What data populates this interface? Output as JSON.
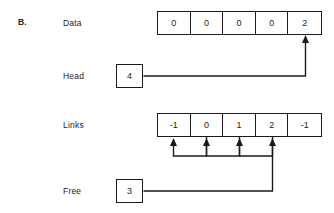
{
  "figure": {
    "part_label": "B.",
    "background_color": "#ffffff",
    "line_color": "#1a1a1a"
  },
  "rows": {
    "data": {
      "label": "Data",
      "cells": [
        "0",
        "0",
        "0",
        "0",
        "2"
      ]
    },
    "head": {
      "label": "Head",
      "value": "4"
    },
    "links": {
      "label": "Links",
      "cells": [
        "-1",
        "0",
        "1",
        "2",
        "-1"
      ]
    },
    "free": {
      "label": "Free",
      "value": "3"
    }
  },
  "pointers": [
    {
      "name": "head-to-data-index-4",
      "from": "Head",
      "to_array": "Data",
      "to_index": 4
    },
    {
      "name": "links-index-1-to-index-0",
      "from_array": "Links",
      "from_index": 1,
      "to_array": "Links",
      "to_index": 0
    },
    {
      "name": "links-index-2-to-index-1",
      "from_array": "Links",
      "from_index": 2,
      "to_array": "Links",
      "to_index": 1
    },
    {
      "name": "links-index-3-to-index-2",
      "from_array": "Links",
      "from_index": 3,
      "to_array": "Links",
      "to_index": 2
    },
    {
      "name": "free-to-links-index-3",
      "from": "Free",
      "to_array": "Links",
      "to_index": 3
    }
  ]
}
